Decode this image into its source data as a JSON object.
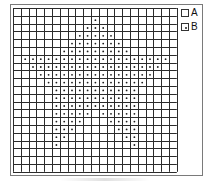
{
  "chart": {
    "rows": 21,
    "cols": 21,
    "cell_px": 7.8,
    "line_color": "#2b2b2b",
    "dot_color": "#1a1a1a",
    "dot_rows": [
      [],
      [
        [
          10,
          10
        ]
      ],
      [
        [
          9,
          11
        ]
      ],
      [
        [
          8,
          12
        ]
      ],
      [
        [
          7,
          13
        ]
      ],
      [
        [
          6,
          14
        ]
      ],
      [
        [
          1,
          19
        ]
      ],
      [
        [
          2,
          18
        ]
      ],
      [
        [
          3,
          17
        ]
      ],
      [
        [
          4,
          16
        ]
      ],
      [
        [
          5,
          15
        ]
      ],
      [
        [
          5,
          15
        ]
      ],
      [
        [
          5,
          15
        ]
      ],
      [
        [
          5,
          9
        ],
        [
          11,
          15
        ]
      ],
      [
        [
          5,
          8
        ],
        [
          12,
          15
        ]
      ],
      [
        [
          5,
          7
        ],
        [
          13,
          15
        ]
      ],
      [
        [
          5,
          6
        ],
        [
          14,
          15
        ]
      ],
      [
        [
          5,
          5
        ],
        [
          15,
          15
        ]
      ],
      [],
      [],
      []
    ]
  },
  "legend": {
    "items": [
      {
        "key": "A",
        "label": "A",
        "symbol": "empty-square"
      },
      {
        "key": "B",
        "label": "B",
        "symbol": "dotted-square"
      }
    ]
  }
}
